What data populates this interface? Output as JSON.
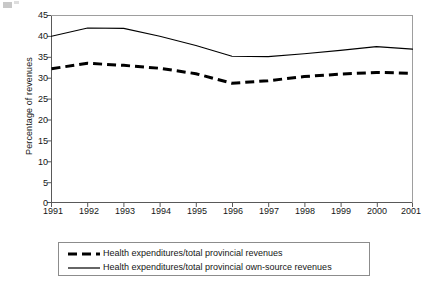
{
  "chart_data": {
    "type": "line",
    "title": "",
    "xlabel": "",
    "ylabel": "Percentage of revenues",
    "x": [
      1991,
      1992,
      1993,
      1994,
      1995,
      1996,
      1997,
      1998,
      1999,
      2000,
      2001
    ],
    "categories": [
      "1991",
      "1992",
      "1993",
      "1994",
      "1995",
      "1996",
      "1997",
      "1998",
      "1999",
      "2000",
      "2001"
    ],
    "xlim": [
      1991,
      2001
    ],
    "ylim": [
      0,
      45
    ],
    "yticks": [
      0,
      5,
      10,
      15,
      20,
      25,
      30,
      35,
      40,
      45
    ],
    "ytick_labels": [
      "0",
      "5",
      "10",
      "15",
      "20",
      "25",
      "30",
      "35",
      "40",
      "45"
    ],
    "grid": false,
    "legend_position": "below",
    "series": [
      {
        "name": "Health expenditures/total provincial revenues",
        "style": "dashed",
        "color": "#000000",
        "width": 3,
        "values": [
          32.2,
          33.5,
          33.0,
          32.3,
          31.0,
          28.7,
          29.3,
          30.3,
          30.9,
          31.3,
          31.1
        ]
      },
      {
        "name": "Health expenditures/total provincial own-source revenues",
        "style": "solid",
        "color": "#000000",
        "width": 1,
        "values": [
          40.0,
          42.0,
          41.9,
          40.0,
          37.8,
          35.2,
          35.1,
          35.8,
          36.6,
          37.5,
          36.9
        ]
      }
    ]
  },
  "axes": {
    "y_title": "Percentage of revenues",
    "y_tick_labels": [
      "45",
      "40",
      "35",
      "30",
      "25",
      "20",
      "15",
      "10",
      "5",
      "0"
    ],
    "x_tick_labels": [
      "1991",
      "1992",
      "1993",
      "1994",
      "1995",
      "1996",
      "1997",
      "1998",
      "1999",
      "2000",
      "2001"
    ]
  },
  "legend": {
    "entries": [
      {
        "label": "Health expenditures/total provincial revenues",
        "key": "dashed-line-key"
      },
      {
        "label": "Health expenditures/total provincial own-source revenues",
        "key": "solid-line-key"
      }
    ]
  },
  "colors": {
    "line": "#000000",
    "axis": "#595959",
    "legend_border": "#8c8c8c",
    "background": "#ffffff",
    "text": "#161616"
  }
}
